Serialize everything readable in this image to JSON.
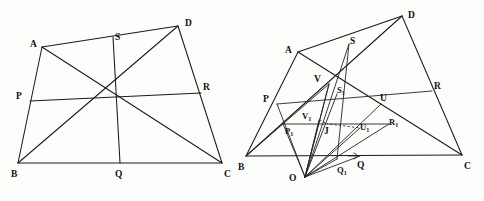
{
  "figure": {
    "background_color": "#fdfdfc",
    "line_color": "#1b1b1b",
    "label_color": "#111111",
    "caption": ""
  },
  "diagrams": [
    {
      "name": "left-quadrilateral",
      "description": "Quadrilateral ABCD with midpoint-like points P, Q, R, S and connecting cevians/diagonals",
      "vertices": [
        {
          "id": "A",
          "label": "A",
          "x": 42,
          "y": 47,
          "label_x": 30,
          "label_y": 47
        },
        {
          "id": "B",
          "label": "B",
          "x": 18,
          "y": 163,
          "label_x": 11,
          "label_y": 176
        },
        {
          "id": "C",
          "label": "C",
          "x": 222,
          "y": 163,
          "label_x": 225,
          "label_y": 176
        },
        {
          "id": "D",
          "label": "D",
          "x": 178,
          "y": 26,
          "label_x": 185,
          "label_y": 25
        }
      ],
      "points": [
        {
          "id": "P",
          "label": "P",
          "x": 30,
          "y": 101,
          "label_x": 17,
          "label_y": 98
        },
        {
          "id": "Q",
          "label": "Q",
          "x": 120,
          "y": 163,
          "label_x": 116,
          "label_y": 176
        },
        {
          "id": "R",
          "label": "R",
          "x": 201,
          "y": 93,
          "label_x": 204,
          "label_y": 89
        },
        {
          "id": "S",
          "label": "S",
          "x": 113,
          "y": 37,
          "label_x": 116,
          "label_y": 38
        }
      ],
      "segments": [
        {
          "from": "A",
          "to": "D",
          "style": "solid"
        },
        {
          "from": "A",
          "to": "B",
          "style": "solid"
        },
        {
          "from": "B",
          "to": "C",
          "style": "solid"
        },
        {
          "from": "D",
          "to": "C",
          "style": "solid"
        },
        {
          "from": "A",
          "to": "C",
          "style": "solid"
        },
        {
          "from": "B",
          "to": "D",
          "style": "solid"
        },
        {
          "from": "P",
          "to": "R",
          "style": "solid"
        },
        {
          "from": "S",
          "to": "Q",
          "style": "solid"
        }
      ]
    },
    {
      "name": "right-quadrilateral",
      "description": "Quadrilateral ABCD with external point O and projected points P1, Q1, R1, S1, U, V, U1, V1, J",
      "vertices": [
        {
          "id": "A",
          "label": "A",
          "x": 298,
          "y": 52,
          "label_x": 286,
          "label_y": 52
        },
        {
          "id": "B",
          "label": "B",
          "x": 246,
          "y": 156,
          "label_x": 239,
          "label_y": 169
        },
        {
          "id": "C",
          "label": "C",
          "x": 462,
          "y": 155,
          "label_x": 465,
          "label_y": 168
        },
        {
          "id": "D",
          "label": "D",
          "x": 402,
          "y": 16,
          "label_x": 409,
          "label_y": 16
        },
        {
          "id": "O",
          "label": "O",
          "x": 305,
          "y": 177,
          "label_x": 291,
          "label_y": 177
        }
      ],
      "points": [
        {
          "id": "P",
          "label": "P",
          "x": 277,
          "y": 104,
          "label_x": 264,
          "label_y": 101
        },
        {
          "id": "Q",
          "label": "Q",
          "x": 358,
          "y": 156,
          "label_x": 359,
          "label_y": 167
        },
        {
          "id": "R",
          "label": "R",
          "x": 432,
          "y": 91,
          "label_x": 435,
          "label_y": 88
        },
        {
          "id": "S",
          "label": "S",
          "x": 349,
          "y": 44,
          "label_x": 352,
          "label_y": 42
        },
        {
          "id": "V",
          "label": "V",
          "x": 329,
          "y": 84,
          "label_x": 316,
          "label_y": 81
        },
        {
          "id": "U",
          "label": "U",
          "x": 381,
          "y": 104,
          "label_x": 382,
          "label_y": 100
        },
        {
          "id": "S1",
          "label": "S",
          "sub": "1",
          "x": 337,
          "y": 94,
          "label_x": 339,
          "label_y": 92
        },
        {
          "id": "V1",
          "label": "V",
          "sub": "1",
          "x": 319,
          "y": 120,
          "label_x": 304,
          "label_y": 118
        },
        {
          "id": "U1",
          "label": "U",
          "sub": "1",
          "x": 360,
          "y": 128,
          "label_x": 362,
          "label_y": 129
        },
        {
          "id": "P1",
          "label": "P",
          "sub": "1",
          "x": 285,
          "y": 124,
          "label_x": 288,
          "label_y": 133
        },
        {
          "id": "R1",
          "label": "R",
          "sub": "1",
          "x": 389,
          "y": 124,
          "label_x": 391,
          "label_y": 124
        },
        {
          "id": "Q1",
          "label": "Q",
          "sub": "1",
          "x": 337,
          "y": 159,
          "label_x": 339,
          "label_y": 172
        },
        {
          "id": "J",
          "label": "J",
          "x": 328,
          "y": 124,
          "label_x": 326,
          "label_y": 133
        }
      ],
      "segments": [
        {
          "from": "A",
          "to": "D",
          "style": "solid"
        },
        {
          "from": "A",
          "to": "B",
          "style": "solid"
        },
        {
          "from": "B",
          "to": "C",
          "style": "solid"
        },
        {
          "from": "D",
          "to": "C",
          "style": "solid"
        },
        {
          "from": "A",
          "to": "C",
          "style": "solid"
        },
        {
          "from": "B",
          "to": "D",
          "style": "solid"
        },
        {
          "from": "P",
          "to": "R1",
          "style": "solid"
        },
        {
          "from": "R1",
          "to": "R",
          "style": "solid"
        },
        {
          "from": "S",
          "to": "Q1",
          "style": "solid"
        },
        {
          "from": "O",
          "to": "A",
          "style": "solid"
        },
        {
          "from": "O",
          "to": "V",
          "style": "solid"
        },
        {
          "from": "O",
          "to": "S1",
          "style": "solid"
        },
        {
          "from": "O",
          "to": "S",
          "style": "solid"
        },
        {
          "from": "O",
          "to": "U",
          "style": "solid"
        },
        {
          "from": "O",
          "to": "R1",
          "style": "solid"
        },
        {
          "from": "O",
          "to": "P1",
          "style": "solid"
        },
        {
          "from": "O",
          "to": "Q",
          "style": "solid"
        },
        {
          "from": "O",
          "to": "Q1",
          "style": "solid"
        },
        {
          "from": "B",
          "to": "V",
          "style": "solid"
        },
        {
          "from": "V1",
          "to": "J",
          "style": "dashed"
        },
        {
          "from": "J",
          "to": "U1",
          "style": "dashed"
        }
      ]
    }
  ],
  "labels_all": [
    "A",
    "B",
    "C",
    "D",
    "P",
    "Q",
    "R",
    "S",
    "O",
    "U",
    "V",
    "J",
    "P1",
    "Q1",
    "R1",
    "S1",
    "U1",
    "V1"
  ]
}
